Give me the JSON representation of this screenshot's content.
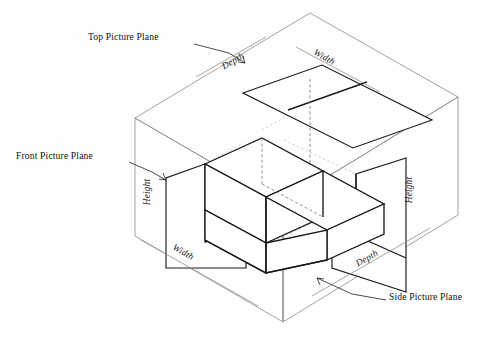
{
  "figure": {
    "background_color": "#fefefe",
    "line_color": "#1a1a1a",
    "glass_color": "#8d8d8d",
    "projection_color": "#b9b9b9"
  },
  "callouts": [
    {
      "id": "top-picture-plane",
      "label": "Top Picture Plane",
      "x": 88,
      "y": 36,
      "leader": "M 194 44 L 227 52 L 245 62"
    },
    {
      "id": "front-picture-plane",
      "label": "Front Picture Plane",
      "x": 16,
      "y": 155,
      "leader": "M 130 163 L 152 172 L 166 180"
    },
    {
      "id": "side-picture-plane",
      "label": "Side Picture Plane",
      "x": 388,
      "y": 295,
      "leader": "M 384 300 L 350 293 L 316 278"
    }
  ],
  "dimensions": [
    {
      "id": "depth-top",
      "label": "Depth",
      "x": 220,
      "y": 62,
      "rotate": -30
    },
    {
      "id": "width-top",
      "label": "Width",
      "x": 313,
      "y": 58,
      "rotate": 29
    },
    {
      "id": "height-front",
      "label": "Height",
      "x": 143,
      "y": 180,
      "rotate": -90
    },
    {
      "id": "width-front",
      "label": "Width",
      "x": 172,
      "y": 252,
      "rotate": 29
    },
    {
      "id": "height-side",
      "label": "Height",
      "x": 404,
      "y": 178,
      "rotate": -90
    },
    {
      "id": "depth-side",
      "label": "Depth",
      "x": 355,
      "y": 258,
      "rotate": -30
    }
  ],
  "geometry": {
    "glass_box": {
      "top_apex": [
        310,
        13
      ],
      "left_corner": [
        135,
        118
      ],
      "right_corner": [
        458,
        97
      ],
      "front_corner": [
        283,
        204
      ],
      "bottom_front": [
        283,
        322
      ],
      "bottom_left": [
        135,
        236
      ],
      "bottom_right": [
        458,
        215
      ]
    },
    "top_plane_quad": "M 243 93 L 322 65 L 432 120 L 353 148 Z",
    "front_plane_outline": "M 166 178 L 166 268 L 246 268 L 246 228 L 205 210 L 205 164 Z",
    "side_plane_outline": "M 332 186 L 332 268 L 406 292 L 406 158 L 356 174 Z"
  },
  "notes": {
    "object_type": "L-shaped block (step block)",
    "planes": 3,
    "view_type": "isometric glass box"
  }
}
